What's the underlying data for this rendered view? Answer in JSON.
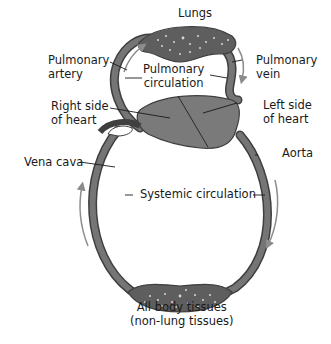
{
  "diagram": {
    "labels": {
      "lungs": "Lungs",
      "pulmonary_artery": [
        "Pulmonary",
        "artery"
      ],
      "pulmonary_vein": [
        "Pulmonary",
        "vein"
      ],
      "pulmonary_circulation": [
        "Pulmonary",
        "circulation"
      ],
      "right_heart": [
        "Right side",
        "of heart"
      ],
      "left_heart": [
        "Left side",
        "of heart"
      ],
      "vena_cava": "Vena cava",
      "aorta": "Aorta",
      "systemic_circulation": "Systemic circulation",
      "body_tissues": [
        "All body tissues",
        "(non-lung tissues)"
      ]
    },
    "colors": {
      "vessel": "#6e6e6e",
      "vessel_edge": "#3f3f3f",
      "heart": "#7a7a7a",
      "arrow": "#8c8c8c",
      "text": "#1a1a1a",
      "leader": "#1a1a1a"
    },
    "flow_arrows": [
      {
        "location": "pulmonary-artery",
        "direction": "up"
      },
      {
        "location": "pulmonary-vein",
        "direction": "down"
      },
      {
        "location": "vena-cava",
        "direction": "up"
      },
      {
        "location": "aorta",
        "direction": "down"
      }
    ]
  }
}
